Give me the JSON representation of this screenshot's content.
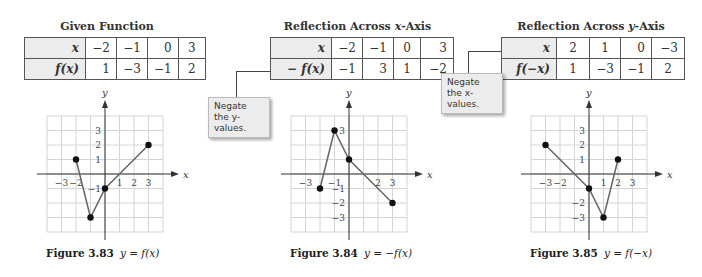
{
  "panels": [
    {
      "title": "Given Function",
      "table": {
        "row_labels": [
          "x",
          "f(x)"
        ],
        "x": [
          "−2",
          "−1",
          "0",
          "3"
        ],
        "y": [
          "1",
          "−3",
          "−1",
          "2"
        ]
      },
      "caption_label": "Figure 3.83",
      "caption_eq": "y = f(x)"
    },
    {
      "title": "Reflection Across x-Axis",
      "table": {
        "row_labels": [
          "x",
          "− f(x)"
        ],
        "x": [
          "−2",
          "−1",
          "0",
          "3"
        ],
        "y": [
          "−1",
          "3",
          "1",
          "−2"
        ]
      },
      "callout": "Negate the y-values.",
      "caption_label": "Figure 3.84",
      "caption_eq": "y = −f(x)"
    },
    {
      "title": "Reflection Across y-Axis",
      "table": {
        "row_labels": [
          "x",
          "f(−x)"
        ],
        "x": [
          "2",
          "1",
          "0",
          "−3"
        ],
        "y": [
          "1",
          "−3",
          "−1",
          "2"
        ]
      },
      "callout": "Negate the x-values.",
      "caption_label": "Figure 3.85",
      "caption_eq": "y = f(−x)"
    }
  ],
  "axis_labels": {
    "x": "x",
    "y": "y"
  },
  "chart_data": [
    {
      "type": "line",
      "title": "y = f(x)",
      "points": [
        [
          -2,
          1
        ],
        [
          -1,
          -3
        ],
        [
          0,
          -1
        ],
        [
          3,
          2
        ]
      ],
      "xlim": [
        -4,
        4
      ],
      "ylim": [
        -4,
        4
      ],
      "x_tick_labels": [
        "−3",
        "−2",
        "1",
        "2",
        "3"
      ],
      "x_ticks": [
        -3,
        -2,
        1,
        2,
        3
      ],
      "y_tick_labels": [
        "3",
        "2",
        "1",
        "−1"
      ],
      "y_ticks": [
        3,
        2,
        1,
        -1
      ],
      "grid": true
    },
    {
      "type": "line",
      "title": "y = −f(x)",
      "points": [
        [
          -2,
          -1
        ],
        [
          -1,
          3
        ],
        [
          0,
          1
        ],
        [
          3,
          -2
        ]
      ],
      "xlim": [
        -4,
        4
      ],
      "ylim": [
        -4,
        4
      ],
      "x_tick_labels": [
        "−3",
        "−1",
        "2",
        "3"
      ],
      "x_ticks": [
        -3,
        -1,
        2,
        3
      ],
      "y_tick_labels": [
        "3",
        "−1",
        "−2",
        "−3"
      ],
      "y_ticks": [
        3,
        -1,
        -2,
        -3
      ],
      "grid": true
    },
    {
      "type": "line",
      "title": "y = f(−x)",
      "points": [
        [
          -3,
          2
        ],
        [
          0,
          -1
        ],
        [
          1,
          -3
        ],
        [
          2,
          1
        ]
      ],
      "xlim": [
        -4,
        4
      ],
      "ylim": [
        -4,
        4
      ],
      "x_tick_labels": [
        "−3",
        "−2",
        "1",
        "2",
        "3"
      ],
      "x_ticks": [
        -3,
        -2,
        1,
        2,
        3
      ],
      "y_tick_labels": [
        "3",
        "2",
        "1",
        "−2",
        "−3"
      ],
      "y_ticks": [
        3,
        2,
        1,
        -2,
        -3
      ],
      "grid": true
    }
  ]
}
